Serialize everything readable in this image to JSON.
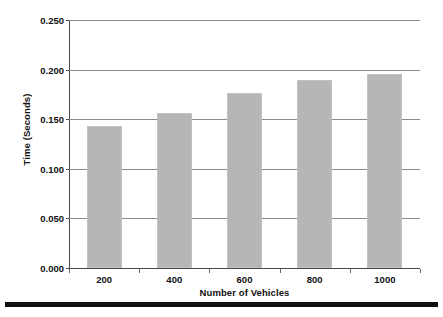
{
  "chart_data": {
    "type": "bar",
    "title": "",
    "xlabel": "Number of Vehicles",
    "ylabel": "Time (Seconds)",
    "categories": [
      "200",
      "400",
      "600",
      "800",
      "1000"
    ],
    "values": [
      0.143,
      0.156,
      0.176,
      0.19,
      0.196
    ],
    "ylim": [
      0.0,
      0.25
    ],
    "yticks": [
      "0.000",
      "0.050",
      "0.100",
      "0.150",
      "0.200",
      "0.250"
    ],
    "ytick_values": [
      0.0,
      0.05,
      0.1,
      0.15,
      0.2,
      0.25
    ],
    "grid": true,
    "legend": "none",
    "bar_color": "#b6b6b6",
    "axis_color": "#4a4a4a",
    "gridline_color": "#8a8a8a",
    "text_color": "#111111"
  }
}
